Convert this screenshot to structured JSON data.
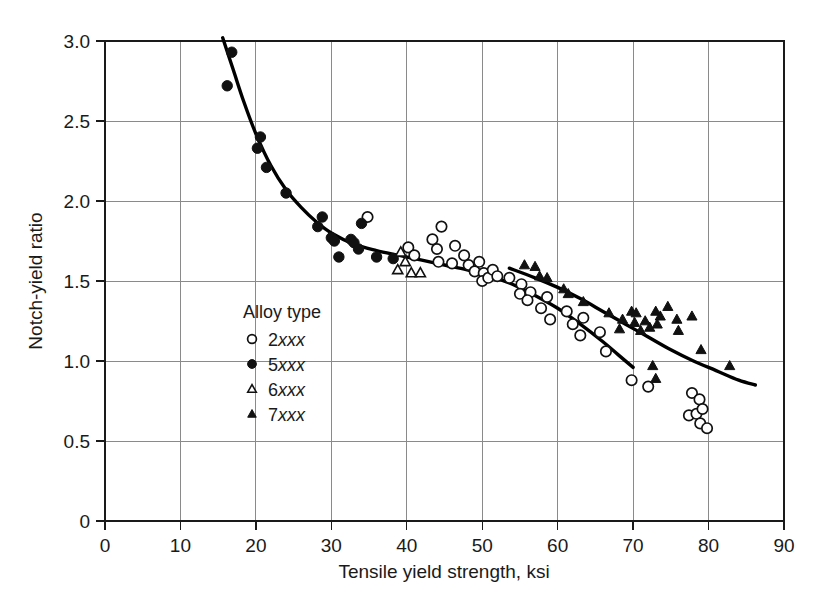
{
  "chart_data": {
    "type": "scatter",
    "title": "",
    "xlabel": "Tensile yield strength, ksi",
    "ylabel": "Notch-yield ratio",
    "xlim": [
      0,
      90
    ],
    "ylim": [
      0,
      3.0
    ],
    "xticks": [
      0,
      10,
      20,
      30,
      40,
      50,
      60,
      70,
      80,
      90
    ],
    "yticks": [
      "0",
      "0.5",
      "1.0",
      "1.5",
      "2.0",
      "2.5",
      "3.0"
    ],
    "ytick_values": [
      0,
      0.5,
      1.0,
      1.5,
      2.0,
      2.5,
      3.0
    ],
    "xtick_labels": [
      "0",
      "10",
      "20",
      "30",
      "40",
      "50",
      "60",
      "70",
      "80",
      "90"
    ],
    "grid": true,
    "legend_position": "inside-lower-left",
    "legend_title": "Alloy type",
    "series": [
      {
        "name": "2xxx",
        "marker": "open-circle",
        "points": [
          [
            34.8,
            1.9
          ],
          [
            40.2,
            1.71
          ],
          [
            41.0,
            1.66
          ],
          [
            43.4,
            1.76
          ],
          [
            44.6,
            1.84
          ],
          [
            44.0,
            1.7
          ],
          [
            44.2,
            1.62
          ],
          [
            46.4,
            1.72
          ],
          [
            47.6,
            1.66
          ],
          [
            46.0,
            1.61
          ],
          [
            48.2,
            1.6
          ],
          [
            49.0,
            1.56
          ],
          [
            49.6,
            1.62
          ],
          [
            50.2,
            1.55
          ],
          [
            50.0,
            1.5
          ],
          [
            50.8,
            1.52
          ],
          [
            51.4,
            1.57
          ],
          [
            52.0,
            1.53
          ],
          [
            53.6,
            1.52
          ],
          [
            55.2,
            1.48
          ],
          [
            55.0,
            1.42
          ],
          [
            56.4,
            1.43
          ],
          [
            56.0,
            1.38
          ],
          [
            57.8,
            1.33
          ],
          [
            58.6,
            1.4
          ],
          [
            59.0,
            1.26
          ],
          [
            61.2,
            1.31
          ],
          [
            62.0,
            1.23
          ],
          [
            63.4,
            1.27
          ],
          [
            63.0,
            1.16
          ],
          [
            65.6,
            1.18
          ],
          [
            66.4,
            1.06
          ],
          [
            69.8,
            0.88
          ],
          [
            72.0,
            0.84
          ],
          [
            77.8,
            0.8
          ],
          [
            78.8,
            0.76
          ],
          [
            77.4,
            0.66
          ],
          [
            78.4,
            0.67
          ],
          [
            79.2,
            0.7
          ],
          [
            78.9,
            0.61
          ],
          [
            79.8,
            0.58
          ]
        ]
      },
      {
        "name": "5xxx",
        "marker": "filled-circle",
        "points": [
          [
            16.8,
            2.93
          ],
          [
            16.2,
            2.72
          ],
          [
            20.6,
            2.4
          ],
          [
            20.2,
            2.33
          ],
          [
            21.4,
            2.21
          ],
          [
            24.0,
            2.05
          ],
          [
            28.8,
            1.9
          ],
          [
            28.2,
            1.84
          ],
          [
            30.0,
            1.77
          ],
          [
            30.4,
            1.75
          ],
          [
            32.6,
            1.76
          ],
          [
            33.0,
            1.74
          ],
          [
            34.0,
            1.86
          ],
          [
            33.6,
            1.7
          ],
          [
            31.0,
            1.65
          ],
          [
            36.0,
            1.65
          ],
          [
            38.2,
            1.64
          ]
        ]
      },
      {
        "name": "6xxx",
        "marker": "open-triangle",
        "points": [
          [
            39.2,
            1.68
          ],
          [
            39.8,
            1.62
          ],
          [
            38.8,
            1.57
          ],
          [
            40.6,
            1.55
          ],
          [
            41.8,
            1.55
          ]
        ]
      },
      {
        "name": "7xxx",
        "marker": "filled-triangle",
        "points": [
          [
            55.6,
            1.6
          ],
          [
            57.0,
            1.59
          ],
          [
            57.6,
            1.53
          ],
          [
            58.6,
            1.52
          ],
          [
            60.8,
            1.45
          ],
          [
            61.4,
            1.42
          ],
          [
            63.4,
            1.37
          ],
          [
            66.8,
            1.3
          ],
          [
            68.6,
            1.26
          ],
          [
            68.2,
            1.2
          ],
          [
            69.8,
            1.31
          ],
          [
            70.4,
            1.3
          ],
          [
            70.2,
            1.24
          ],
          [
            71.0,
            1.19
          ],
          [
            71.6,
            1.25
          ],
          [
            72.2,
            1.21
          ],
          [
            73.0,
            1.31
          ],
          [
            73.6,
            1.28
          ],
          [
            73.2,
            1.23
          ],
          [
            74.6,
            1.34
          ],
          [
            75.8,
            1.26
          ],
          [
            76.0,
            1.19
          ],
          [
            77.8,
            1.28
          ],
          [
            72.6,
            0.97
          ],
          [
            73.0,
            0.89
          ],
          [
            79.0,
            1.07
          ],
          [
            82.8,
            0.97
          ]
        ]
      }
    ],
    "trend_curves": [
      {
        "name": "main-curve",
        "description": "Main descending curve through 5xxx, 2xxx and lower data",
        "points": [
          [
            15.6,
            3.02
          ],
          [
            17.0,
            2.82
          ],
          [
            18.4,
            2.62
          ],
          [
            20.0,
            2.42
          ],
          [
            22.0,
            2.22
          ],
          [
            24.0,
            2.07
          ],
          [
            26.0,
            1.96
          ],
          [
            28.0,
            1.87
          ],
          [
            30.0,
            1.8
          ],
          [
            33.0,
            1.73
          ],
          [
            36.0,
            1.69
          ],
          [
            39.0,
            1.66
          ],
          [
            42.0,
            1.63
          ],
          [
            45.0,
            1.6
          ],
          [
            48.0,
            1.57
          ],
          [
            51.0,
            1.53
          ],
          [
            54.0,
            1.48
          ],
          [
            57.0,
            1.41
          ],
          [
            60.0,
            1.33
          ],
          [
            63.0,
            1.23
          ],
          [
            66.0,
            1.12
          ],
          [
            68.0,
            1.04
          ],
          [
            70.0,
            0.96
          ]
        ]
      },
      {
        "name": "upper-7xxx-curve",
        "description": "Upper curve through the 7xxx alloy band",
        "points": [
          [
            53.6,
            1.58
          ],
          [
            57.0,
            1.52
          ],
          [
            60.0,
            1.46
          ],
          [
            63.0,
            1.39
          ],
          [
            66.0,
            1.31
          ],
          [
            69.0,
            1.23
          ],
          [
            72.0,
            1.15
          ],
          [
            75.0,
            1.07
          ],
          [
            78.0,
            1.0
          ],
          [
            81.0,
            0.94
          ],
          [
            84.0,
            0.88
          ],
          [
            86.2,
            0.85
          ]
        ]
      }
    ],
    "legend_entries": [
      {
        "marker": "open-circle",
        "label": "2",
        "label_italic": "xxx"
      },
      {
        "marker": "filled-circle",
        "label": "5",
        "label_italic": "xxx"
      },
      {
        "marker": "open-triangle",
        "label": "6",
        "label_italic": "xxx"
      },
      {
        "marker": "filled-triangle",
        "label": "7",
        "label_italic": "xxx"
      }
    ],
    "colors": {
      "marker": "#111111",
      "curve": "#000000",
      "grid": "#8a8a8a",
      "frame": "#1a1a1a",
      "background": "#ffffff"
    }
  }
}
